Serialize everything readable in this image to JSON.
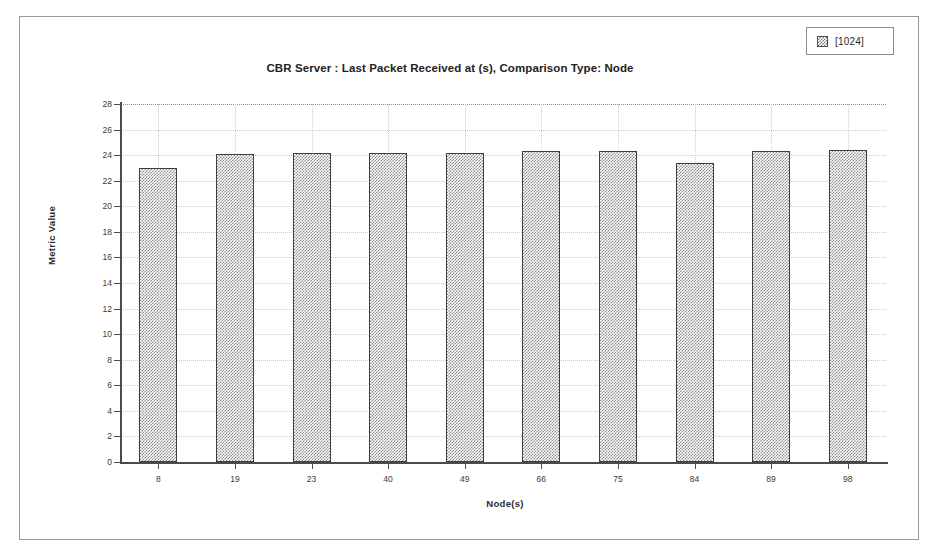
{
  "chart_data": {
    "type": "bar",
    "title": "CBR Server :  Last Packet Received at (s), Comparison Type: Node",
    "xlabel": "Node(s)",
    "ylabel": "Metric Value",
    "categories": [
      "8",
      "19",
      "23",
      "40",
      "49",
      "66",
      "75",
      "84",
      "89",
      "98"
    ],
    "series": [
      {
        "name": "[1024]",
        "values": [
          23.0,
          24.1,
          24.15,
          24.2,
          24.2,
          24.3,
          24.3,
          23.4,
          24.3,
          24.4
        ]
      }
    ],
    "ylim": [
      0,
      28
    ],
    "yticks": [
      0,
      2,
      4,
      6,
      8,
      10,
      12,
      14,
      16,
      18,
      20,
      22,
      24,
      26,
      28
    ],
    "ytick_labels": [
      "0",
      "2",
      "4",
      "6",
      "8",
      "10",
      "12",
      "14",
      "16",
      "18",
      "20",
      "22",
      "24",
      "26",
      "28"
    ],
    "grid": true,
    "legend_position": "top-right"
  },
  "legend": {
    "entries": [
      {
        "label": "[1024]",
        "swatch": "hatched-gray-swatch"
      }
    ]
  },
  "colors": {
    "bar_fill": "#8a8a8a",
    "bar_border": "#3f3f3f",
    "axis": "#4b4b4b",
    "grid": "#c9c9c9",
    "frame": "#9a9a9a",
    "text": "#2b2b2b"
  }
}
